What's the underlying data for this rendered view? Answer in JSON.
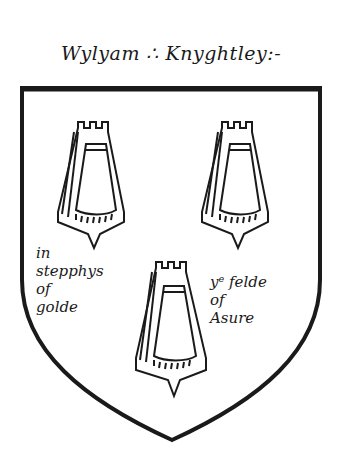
{
  "title": "Wylyam ∴ Knyghtley:-",
  "shield": {
    "outline_color": "#1a1a1a",
    "field_color": "#ffffff",
    "charges_count": 3,
    "charge_type": "embattled-charge"
  },
  "annotations": {
    "left": {
      "line1": "in",
      "line2": "stepphys",
      "line3": "of",
      "line4": "golde"
    },
    "right": {
      "line1": "yᵉ felde",
      "line2": "of",
      "line3": "Asure"
    }
  }
}
